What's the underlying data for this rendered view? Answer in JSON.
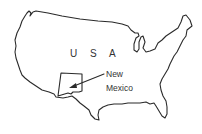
{
  "map": {
    "country_label": "U S A",
    "highlighted_state": {
      "label_line1": "New",
      "label_line2": "Mexico"
    },
    "colors": {
      "background": "#ffffff",
      "outline": "#2a2a2a",
      "text": "#333333"
    }
  }
}
